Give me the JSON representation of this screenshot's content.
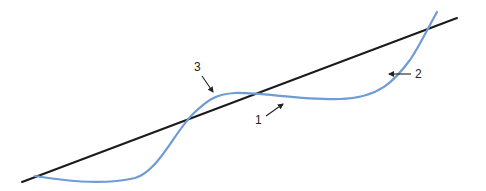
{
  "diagram": {
    "colors": {
      "background": "#ffffff",
      "reference_line": "#1a1a1a",
      "curve": "#6f9bd6",
      "annotation": "#222222"
    },
    "reference_line": {
      "x1": 22,
      "y1": 182,
      "x2": 457,
      "y2": 18
    },
    "curve_path": "M 35 176 C 60 180, 100 186, 135 178 C 160 170, 175 130, 195 112 C 207 101, 215 94, 235 93 C 260 92, 300 100, 340 99 C 380 98, 395 80, 410 60 C 420 45, 428 28, 437 12",
    "annotations": [
      {
        "label": "3",
        "text_x": 194,
        "text_y": 71,
        "arrow": {
          "x1": 202,
          "y1": 76,
          "x2": 213,
          "y2": 92
        }
      },
      {
        "label": "1",
        "text_x": 255,
        "text_y": 124,
        "arrow": {
          "x1": 266,
          "y1": 116,
          "x2": 283,
          "y2": 104
        }
      },
      {
        "label": "2",
        "text_x": 415,
        "text_y": 78,
        "arrow": {
          "x1": 411,
          "y1": 74,
          "x2": 389,
          "y2": 74
        }
      }
    ]
  }
}
